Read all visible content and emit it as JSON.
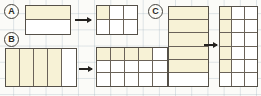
{
  "worksheet": {
    "title": "Fraction area models — equivalent fraction subdivision",
    "background": "grid-paper",
    "grid_color": "#96aab9",
    "shade_color": "#f7f2d6",
    "outline_color": "#555048",
    "arrow_color": "#23211e"
  },
  "parts": [
    {
      "label": "A",
      "source": {
        "name": "source-model-a",
        "rows": 2,
        "cols": 1,
        "shaded_cells": [
          0
        ],
        "total_cells": 2,
        "shaded_count": 1,
        "fraction": "1/2"
      },
      "arrow": {
        "name": "arrow-a",
        "direction": "right"
      },
      "result": {
        "name": "result-model-a",
        "rows": 2,
        "cols": 3,
        "shaded_cells": [
          0
        ],
        "total_cells": 6,
        "shaded_count": 1,
        "fraction": "1/6"
      }
    },
    {
      "label": "B",
      "source": {
        "name": "source-model-b",
        "rows": 1,
        "cols": 5,
        "shaded_cells": [
          0,
          1,
          2,
          3
        ],
        "total_cells": 5,
        "shaded_count": 4,
        "fraction": "4/5"
      },
      "arrow": {
        "name": "arrow-b",
        "direction": "right"
      },
      "result": {
        "name": "result-model-b",
        "rows": 3,
        "cols": 5,
        "shaded_cells": [
          0,
          1,
          2,
          3
        ],
        "total_cells": 15,
        "shaded_count": 4,
        "fraction": "4/15"
      }
    },
    {
      "label": "C",
      "source": {
        "name": "source-model-c",
        "rows": 6,
        "cols": 1,
        "shaded_cells": [
          0,
          1,
          2,
          3,
          4
        ],
        "total_cells": 6,
        "shaded_count": 5,
        "fraction": "5/6"
      },
      "arrow": {
        "name": "arrow-c",
        "direction": "right"
      },
      "result": {
        "name": "result-model-c",
        "rows": 6,
        "cols": 3,
        "shaded_cells": [
          0,
          3,
          6,
          9,
          12
        ],
        "total_cells": 18,
        "shaded_count": 5,
        "fraction": "5/18"
      }
    }
  ]
}
